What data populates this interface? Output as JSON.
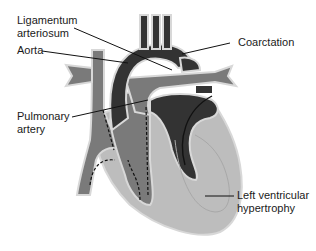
{
  "diagram": {
    "colors": {
      "background": "#ffffff",
      "oxygenated_dark": "#333333",
      "deoxygenated_mid": "#7a7a7a",
      "myocardium_light": "#bdbdbd",
      "outline": "#d8d8d8",
      "leader_line": "#111111",
      "text": "#1a1a1a"
    },
    "labels": {
      "ligamentum": {
        "line1": "Ligamentum",
        "line2": "arteriosum"
      },
      "aorta": {
        "line1": "Aorta"
      },
      "coarctation": {
        "line1": "Coarctation"
      },
      "pulmonary": {
        "line1": "Pulmonary",
        "line2": "artery"
      },
      "lvh": {
        "line1": "Left ventricular",
        "line2": "hypertrophy"
      }
    }
  }
}
